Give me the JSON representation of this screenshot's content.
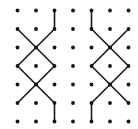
{
  "diagram": {
    "grid": {
      "columns": 7,
      "rows": 7
    },
    "colors": {
      "dot": "#111111",
      "line": "#1a1a1a",
      "background": "#ffffff"
    },
    "figures": [
      {
        "name": "left-figure",
        "segments": [
          [
            [
              2,
              0
            ],
            [
              2,
              1
            ]
          ],
          [
            [
              0,
              1
            ],
            [
              1,
              2
            ]
          ],
          [
            [
              1,
              2
            ],
            [
              2,
              3
            ]
          ],
          [
            [
              2,
              1
            ],
            [
              1,
              2
            ]
          ],
          [
            [
              1,
              2
            ],
            [
              0,
              3
            ]
          ],
          [
            [
              0,
              3
            ],
            [
              1,
              4
            ]
          ],
          [
            [
              1,
              4
            ],
            [
              2,
              5
            ]
          ],
          [
            [
              2,
              3
            ],
            [
              1,
              4
            ]
          ],
          [
            [
              1,
              4
            ],
            [
              0,
              5
            ]
          ],
          [
            [
              2,
              5
            ],
            [
              2,
              6
            ]
          ]
        ]
      },
      {
        "name": "right-figure",
        "segments": [
          [
            [
              4,
              0
            ],
            [
              4,
              1
            ]
          ],
          [
            [
              4,
              1
            ],
            [
              5,
              2
            ]
          ],
          [
            [
              5,
              2
            ],
            [
              6,
              3
            ]
          ],
          [
            [
              6,
              1
            ],
            [
              5,
              2
            ]
          ],
          [
            [
              5,
              2
            ],
            [
              4,
              3
            ]
          ],
          [
            [
              4,
              3
            ],
            [
              5,
              4
            ]
          ],
          [
            [
              5,
              4
            ],
            [
              6,
              5
            ]
          ],
          [
            [
              6,
              3
            ],
            [
              5,
              4
            ]
          ],
          [
            [
              5,
              4
            ],
            [
              4,
              5
            ]
          ],
          [
            [
              4,
              5
            ],
            [
              4,
              6
            ]
          ]
        ]
      }
    ]
  }
}
